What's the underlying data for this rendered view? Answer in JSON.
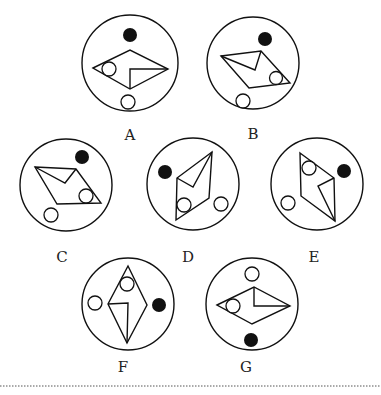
{
  "figures": [
    {
      "label": "A"
    },
    {
      "label": "B"
    },
    {
      "label": "C"
    },
    {
      "label": "D"
    },
    {
      "label": "E"
    },
    {
      "label": "F"
    },
    {
      "label": "G"
    }
  ],
  "colors": {
    "stroke": "#111111",
    "background": "#ffffff"
  }
}
